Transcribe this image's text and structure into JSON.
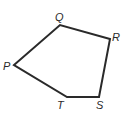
{
  "figure": {
    "type": "pentagon",
    "stroke_color": "#2a2a2a",
    "vertices": [
      {
        "name": "P",
        "x": 14,
        "y": 65,
        "label_x": 3,
        "label_y": 70
      },
      {
        "name": "Q",
        "x": 60,
        "y": 25,
        "label_x": 55,
        "label_y": 21
      },
      {
        "name": "R",
        "x": 110,
        "y": 39,
        "label_x": 112,
        "label_y": 41
      },
      {
        "name": "S",
        "x": 99,
        "y": 97,
        "label_x": 96,
        "label_y": 109
      },
      {
        "name": "T",
        "x": 67,
        "y": 97,
        "label_x": 57,
        "label_y": 109
      }
    ]
  }
}
